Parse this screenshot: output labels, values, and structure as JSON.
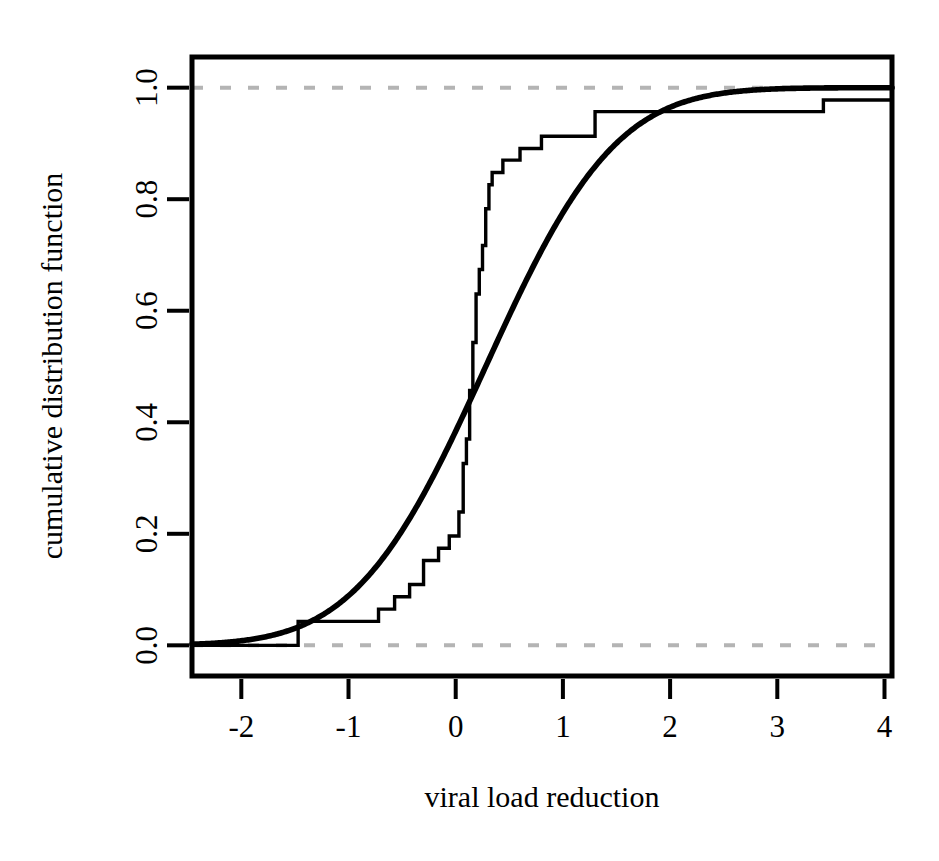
{
  "chart_data": {
    "type": "line",
    "title": "",
    "xlabel": "viral load reduction",
    "ylabel": "cumulative distribution function",
    "xlim": [
      -2.46,
      4.07
    ],
    "ylim": [
      -0.055,
      1.055
    ],
    "xticks": [
      -2,
      -1,
      0,
      1,
      2,
      3,
      4
    ],
    "xticklabels": [
      "-2",
      "-1",
      "0",
      "1",
      "2",
      "3",
      "4"
    ],
    "yticks": [
      0.0,
      0.2,
      0.4,
      0.6,
      0.8,
      1.0
    ],
    "yticklabels": [
      "0.0",
      "0.2",
      "0.4",
      "0.6",
      "0.8",
      "1.0"
    ],
    "grid": false,
    "legend": "none",
    "box": true,
    "series": [
      {
        "name": "empirical cumulative distribution function",
        "type": "step",
        "style": "solid",
        "color": "#000000",
        "linewidth": 3,
        "x": [
          -2.46,
          -1.72,
          -1.47,
          -0.86,
          -0.72,
          -0.57,
          -0.43,
          -0.3,
          -0.16,
          -0.06,
          0.03,
          0.07,
          0.1,
          0.13,
          0.16,
          0.19,
          0.22,
          0.25,
          0.28,
          0.31,
          0.34,
          0.44,
          0.6,
          0.8,
          1.3,
          3.43,
          4.07
        ],
        "y": [
          0.0,
          0.0,
          0.043,
          0.043,
          0.065,
          0.087,
          0.109,
          0.152,
          0.174,
          0.196,
          0.239,
          0.326,
          0.37,
          0.457,
          0.543,
          0.63,
          0.674,
          0.717,
          0.783,
          0.826,
          0.848,
          0.87,
          0.891,
          0.913,
          0.957,
          0.978,
          1.0
        ]
      },
      {
        "name": "fitted normal cumulative distribution function",
        "type": "curve",
        "style": "solid",
        "color": "#000000",
        "linewidth": 5,
        "mu": 0.28,
        "sigma": 0.95,
        "note": "smooth sigmoid fit rising from 0 near x=-2.4 to 1 near x=3.5"
      }
    ],
    "reference_lines": [
      {
        "name": "upper-bound",
        "y": 1.0,
        "style": "dashed",
        "color": "#b4b4b4",
        "linewidth": 4
      },
      {
        "name": "lower-bound",
        "y": 0.0,
        "style": "dashed",
        "color": "#b4b4b4",
        "linewidth": 4
      }
    ]
  },
  "axes": {
    "x_title": "viral load reduction",
    "y_title": "cumulative distribution function"
  }
}
